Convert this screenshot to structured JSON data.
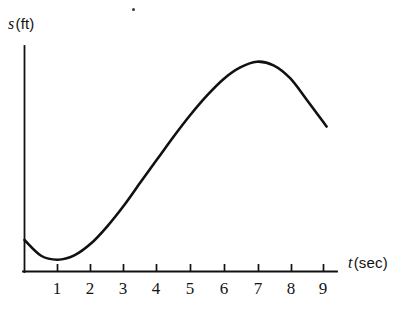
{
  "figure": {
    "name": "position-vs-time-graph",
    "background_color": "#ffffff",
    "ink_color": "#111111"
  },
  "axes": {
    "y_label_symbol": "s",
    "y_label_unit": "(ft)",
    "x_label_symbol": "t",
    "x_label_unit": "(sec)"
  },
  "artifacts": {
    "speck_name": "scan-speck"
  },
  "chart_data": {
    "type": "line",
    "title": "",
    "xlabel": "t (sec)",
    "ylabel": "s (ft)",
    "xlim": [
      0,
      10
    ],
    "ylim": [
      0,
      7
    ],
    "grid": false,
    "legend": false,
    "x_ticks": [
      1,
      2,
      3,
      4,
      5,
      6,
      7,
      8,
      9
    ],
    "x_tick_labels": [
      "1",
      "2",
      "3",
      "4",
      "5",
      "6",
      "7",
      "8",
      "9"
    ],
    "y_ticks": [],
    "y_tick_labels": [],
    "series": [
      {
        "name": "position",
        "color": "#111111",
        "linewidth": 2.6,
        "x": [
          0.0,
          0.5,
          1.0,
          1.5,
          2.0,
          2.5,
          3.0,
          3.5,
          4.0,
          4.5,
          5.0,
          5.5,
          6.0,
          6.5,
          7.0,
          7.5,
          8.0,
          8.5,
          9.1
        ],
        "y": [
          0.88,
          0.44,
          0.33,
          0.45,
          0.78,
          1.27,
          1.85,
          2.5,
          3.14,
          3.78,
          4.38,
          4.92,
          5.38,
          5.7,
          5.86,
          5.76,
          5.4,
          4.8,
          4.05
        ]
      }
    ],
    "annotations": [
      {
        "text": "local minimum near t = 1",
        "x": 1.0,
        "y": 0.33
      },
      {
        "text": "local maximum near t = 7",
        "x": 7.0,
        "y": 5.86
      }
    ]
  }
}
